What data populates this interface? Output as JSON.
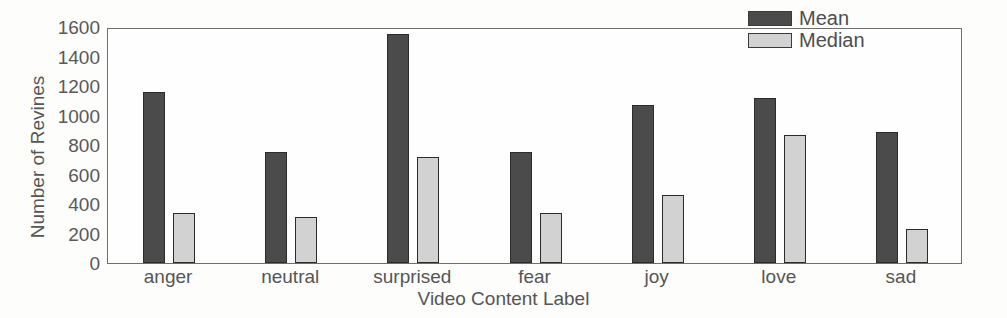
{
  "chart_data": {
    "type": "bar",
    "title": "",
    "xlabel": "Video Content Label",
    "ylabel": "Number of Revines",
    "categories": [
      "anger",
      "neutral",
      "surprised",
      "fear",
      "joy",
      "love",
      "sad"
    ],
    "series": [
      {
        "name": "Mean",
        "color": "#4b4b4b",
        "values": [
          1160,
          750,
          1550,
          750,
          1070,
          1120,
          890
        ]
      },
      {
        "name": "Median",
        "color": "#d2d2d2",
        "values": [
          340,
          310,
          720,
          340,
          460,
          865,
          230
        ]
      }
    ],
    "ylim": [
      0,
      1600
    ],
    "yticks": [
      0,
      200,
      400,
      600,
      800,
      1000,
      1200,
      1400,
      1600
    ],
    "ytick_labels": [
      "0",
      "200",
      "400",
      "600",
      "800",
      "1000",
      "1200",
      "1400",
      "1600"
    ],
    "grid": false,
    "legend_position": "top-right",
    "legend": [
      "Mean",
      "Median"
    ]
  },
  "axes": {
    "y_axis_title": "Number of Revines",
    "x_axis_title": "Video Content Label"
  }
}
